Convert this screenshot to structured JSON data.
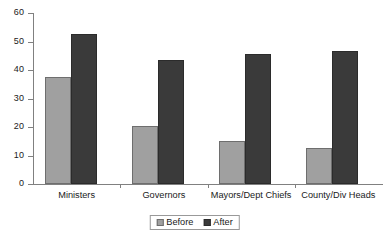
{
  "chart_data": {
    "type": "bar",
    "title": "",
    "subtitle": "",
    "xlabel": "",
    "ylabel": "",
    "ylim": [
      0,
      60
    ],
    "ytick_step": 10,
    "ytick_labels": [
      "60",
      "50",
      "40",
      "30",
      "20",
      "10",
      "0"
    ],
    "ytick_values": [
      60,
      50,
      40,
      30,
      20,
      10,
      0
    ],
    "grid": false,
    "legend_position": "bottom-center",
    "categories": [
      "Ministers",
      "Governors",
      "Mayors/Dept Chiefs",
      "County/Div Heads"
    ],
    "series": [
      {
        "name": "Before",
        "color": "#a0a0a0",
        "values": [
          37.5,
          20.5,
          15.0,
          12.5
        ]
      },
      {
        "name": "After",
        "color": "#3a3a3a",
        "values": [
          52.5,
          43.5,
          45.5,
          46.5
        ]
      }
    ],
    "annotations": []
  },
  "legend": {
    "entries": [
      {
        "label": "Before",
        "swatch": "legend-swatch-before"
      },
      {
        "label": "After",
        "swatch": "legend-swatch-after"
      }
    ]
  },
  "colors": {
    "before": "#a0a0a0",
    "after": "#3a3a3a",
    "axis": "#808080",
    "text": "#1a1a1a",
    "background": "#ffffff"
  }
}
